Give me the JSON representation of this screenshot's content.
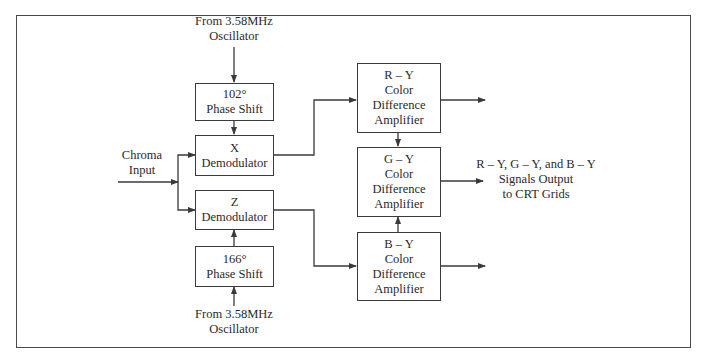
{
  "diagram": {
    "colors": {
      "stroke": "#3a3a3a",
      "text": "#2a2a2a",
      "background": "#ffffff"
    },
    "labels": {
      "osc_top": [
        "From 3.58MHz",
        "Oscillator"
      ],
      "osc_bottom": [
        "From 3.58MHz",
        "Oscillator"
      ],
      "chroma_input": [
        "Chroma",
        "Input"
      ],
      "output": [
        "R – Y, G – Y, and B – Y",
        "Signals Output",
        "to CRT Grids"
      ]
    },
    "blocks": {
      "phase_shift_102": [
        "102°",
        "Phase Shift"
      ],
      "x_demodulator": [
        "X",
        "Demodulator"
      ],
      "z_demodulator": [
        "Z",
        "Demodulator"
      ],
      "phase_shift_166": [
        "166°",
        "Phase Shift"
      ],
      "r_y_amp": [
        "R – Y",
        "Color",
        "Difference",
        "Amplifier"
      ],
      "g_y_amp": [
        "G – Y",
        "Color",
        "Difference",
        "Amplifier"
      ],
      "b_y_amp": [
        "B – Y",
        "Color",
        "Difference",
        "Amplifier"
      ]
    },
    "connections": [
      {
        "from": "osc_top",
        "to": "phase_shift_102"
      },
      {
        "from": "phase_shift_102",
        "to": "x_demodulator"
      },
      {
        "from": "chroma_input",
        "to": "x_demodulator"
      },
      {
        "from": "chroma_input",
        "to": "z_demodulator"
      },
      {
        "from": "osc_bottom",
        "to": "phase_shift_166"
      },
      {
        "from": "phase_shift_166",
        "to": "z_demodulator"
      },
      {
        "from": "x_demodulator",
        "to": "r_y_amp"
      },
      {
        "from": "z_demodulator",
        "to": "b_y_amp"
      },
      {
        "from": "r_y_amp",
        "to": "g_y_amp"
      },
      {
        "from": "b_y_amp",
        "to": "g_y_amp"
      },
      {
        "from": "r_y_amp",
        "to": "output_r"
      },
      {
        "from": "g_y_amp",
        "to": "output"
      },
      {
        "from": "b_y_amp",
        "to": "output_b"
      }
    ]
  }
}
